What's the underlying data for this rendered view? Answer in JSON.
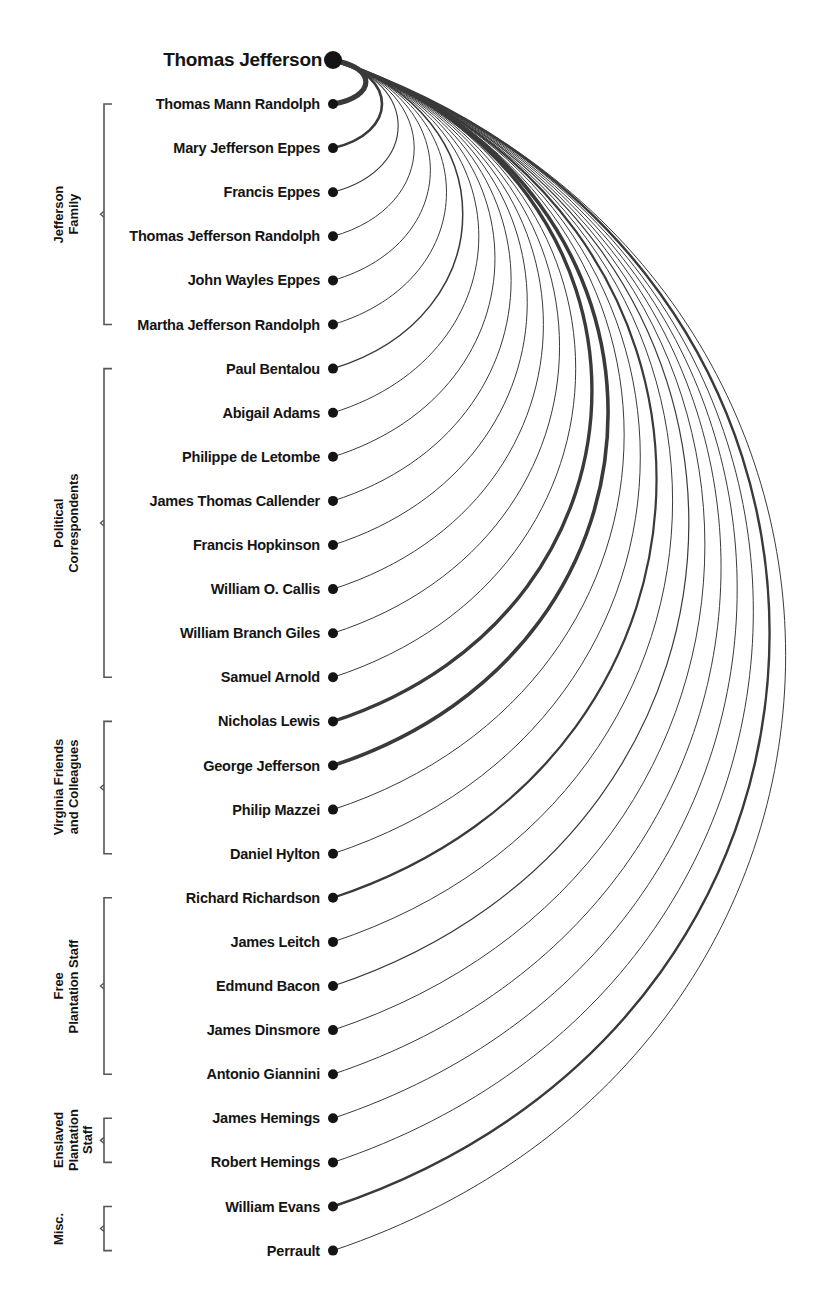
{
  "diagram": {
    "title": "Thomas Jefferson",
    "type": "arc-diagram",
    "root": {
      "name": "Thomas Jefferson",
      "y": 60,
      "node_radius": 9
    },
    "geometry": {
      "node_x": 333,
      "row_start_y": 104,
      "row_spacing": 44.1,
      "bracket_x": 104,
      "bracket_tip": 8
    },
    "groups": [
      {
        "id": "jefferson-family",
        "label": "Jefferson\nFamily",
        "label_line1": "Jefferson",
        "label_line2": "Family",
        "start_index": 0,
        "end_index": 5
      },
      {
        "id": "political-correspondents",
        "label": "Political\nCorrespondents",
        "label_line1": "Political",
        "label_line2": "Correspondents",
        "start_index": 6,
        "end_index": 13
      },
      {
        "id": "virginia-friends",
        "label": "Virginia Friends\nand Colleagues",
        "label_line1": "Virginia Friends",
        "label_line2": "and Colleagues",
        "start_index": 14,
        "end_index": 17
      },
      {
        "id": "free-plantation-staff",
        "label": "Free\nPlantation Staff",
        "label_line1": "Free",
        "label_line2": "Plantation Staff",
        "start_index": 18,
        "end_index": 22
      },
      {
        "id": "enslaved-plantation-staff",
        "label": "Enslaved\nPlantation Staff",
        "label_line1": "Enslaved",
        "label_line2": "Plantation",
        "label_line3": "Staff",
        "start_index": 23,
        "end_index": 24
      },
      {
        "id": "misc",
        "label": "Misc.",
        "label_line1": "Misc.",
        "start_index": 25,
        "end_index": 26
      }
    ],
    "nodes": [
      {
        "name": "Thomas Mann Randolph",
        "weight": 5.2,
        "group": "jefferson-family"
      },
      {
        "name": "Mary Jefferson Eppes",
        "weight": 2.6,
        "group": "jefferson-family"
      },
      {
        "name": "Francis Eppes",
        "weight": 1.1,
        "group": "jefferson-family"
      },
      {
        "name": "Thomas Jefferson Randolph",
        "weight": 1.0,
        "group": "jefferson-family"
      },
      {
        "name": "John Wayles Eppes",
        "weight": 1.0,
        "group": "jefferson-family"
      },
      {
        "name": "Martha Jefferson Randolph",
        "weight": 1.0,
        "group": "jefferson-family"
      },
      {
        "name": "Paul Bentalou",
        "weight": 1.5,
        "group": "political-correspondents"
      },
      {
        "name": "Abigail Adams",
        "weight": 1.0,
        "group": "political-correspondents"
      },
      {
        "name": "Philippe de Letombe",
        "weight": 1.0,
        "group": "political-correspondents"
      },
      {
        "name": "James Thomas Callender",
        "weight": 1.0,
        "group": "political-correspondents"
      },
      {
        "name": "Francis Hopkinson",
        "weight": 1.0,
        "group": "political-correspondents"
      },
      {
        "name": "William O. Callis",
        "weight": 1.0,
        "group": "political-correspondents"
      },
      {
        "name": "William Branch Giles",
        "weight": 1.0,
        "group": "political-correspondents"
      },
      {
        "name": "Samuel Arnold",
        "weight": 1.0,
        "group": "political-correspondents"
      },
      {
        "name": "Nicholas Lewis",
        "weight": 3.4,
        "group": "virginia-friends"
      },
      {
        "name": "George Jefferson",
        "weight": 3.6,
        "group": "virginia-friends"
      },
      {
        "name": "Philip Mazzei",
        "weight": 1.0,
        "group": "virginia-friends"
      },
      {
        "name": "Daniel Hylton",
        "weight": 1.0,
        "group": "virginia-friends"
      },
      {
        "name": "Richard Richardson",
        "weight": 2.2,
        "group": "free-plantation-staff"
      },
      {
        "name": "James Leitch",
        "weight": 1.0,
        "group": "free-plantation-staff"
      },
      {
        "name": "Edmund Bacon",
        "weight": 1.2,
        "group": "free-plantation-staff"
      },
      {
        "name": "James Dinsmore",
        "weight": 1.0,
        "group": "free-plantation-staff"
      },
      {
        "name": "Antonio Giannini",
        "weight": 1.0,
        "group": "free-plantation-staff"
      },
      {
        "name": "James Hemings",
        "weight": 1.0,
        "group": "enslaved-plantation-staff"
      },
      {
        "name": "Robert Hemings",
        "weight": 1.0,
        "group": "enslaved-plantation-staff"
      },
      {
        "name": "William Evans",
        "weight": 2.4,
        "group": "misc"
      },
      {
        "name": "Perrault",
        "weight": 1.0,
        "group": "misc"
      }
    ],
    "colors": {
      "ink": "#141414",
      "arc": "#3a3a3a",
      "bracket": "#555555",
      "background": "#ffffff"
    }
  }
}
